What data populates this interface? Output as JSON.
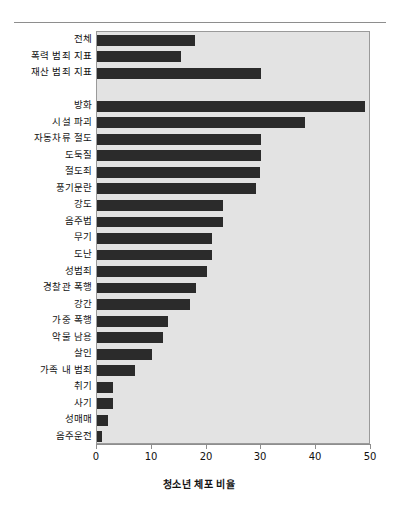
{
  "chart_data": {
    "type": "bar",
    "orientation": "horizontal",
    "title": "",
    "xlabel": "청소년 체포 비율",
    "ylabel": "",
    "xlim": [
      0,
      50
    ],
    "ylim": null,
    "grid": false,
    "legend": null,
    "xticks": [
      0,
      10,
      20,
      30,
      40,
      50
    ],
    "xticklabels": [
      "0",
      "10",
      "20",
      "30",
      "40",
      "50"
    ],
    "bar_color": "#2b2b2b",
    "plot_background": "#e3e3e3",
    "categories": [
      "전체",
      "폭력 범죄 지표",
      "재산 범죄 지표",
      "",
      "방화",
      "시설 파괴",
      "자동차류 절도",
      "도둑질",
      "절도죄",
      "풍기문란",
      "강도",
      "음주법",
      "무기",
      "도난",
      "성범죄",
      "경찰관 폭행",
      "강간",
      "가중 폭행",
      "악물 남용",
      "살인",
      "가족 내 범죄",
      "취기",
      "사기",
      "성매매",
      "음주운전"
    ],
    "values": [
      17.8,
      15.3,
      30.0,
      null,
      48.9,
      38.0,
      30.0,
      30.0,
      29.8,
      29.0,
      23.0,
      23.0,
      21.0,
      21.0,
      20.0,
      18.0,
      17.0,
      13.0,
      12.0,
      10.0,
      7.0,
      3.0,
      3.0,
      2.0,
      1.0
    ]
  },
  "axis": {
    "xtitle": "청소년 체포 비율"
  }
}
